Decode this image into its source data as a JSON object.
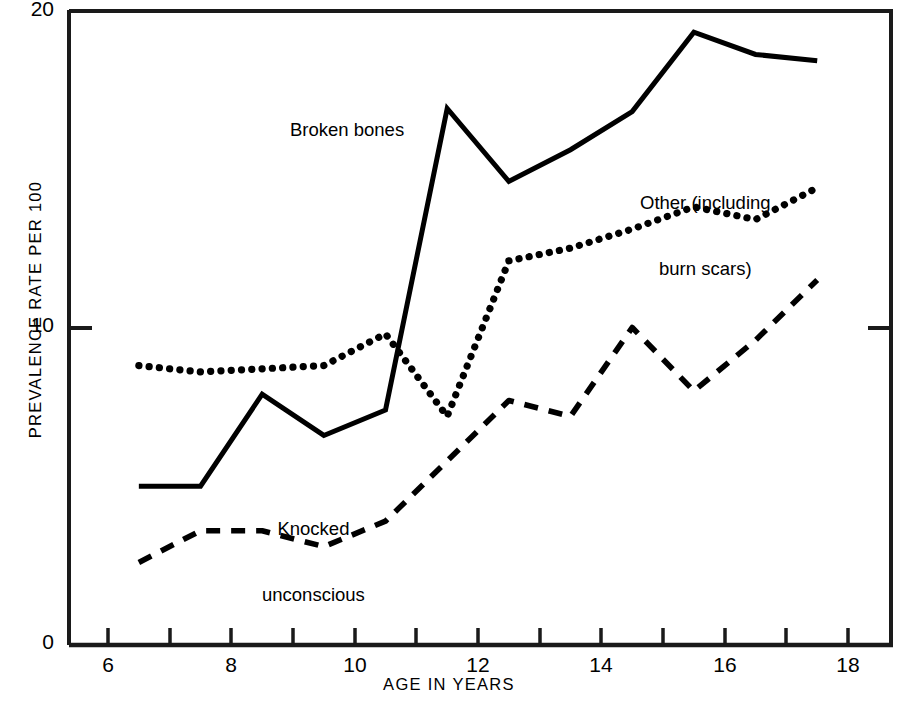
{
  "chart_data": {
    "type": "line",
    "title": "",
    "xlabel": "AGE IN YEARS",
    "ylabel": "PREVALENCE RATE PER 100",
    "xlim": [
      5.3,
      18.7
    ],
    "ylim": [
      0,
      20
    ],
    "x_ticks": [
      6,
      7,
      8,
      9,
      10,
      11,
      12,
      13,
      14,
      15,
      16,
      17,
      18
    ],
    "x_tick_labels": [
      "6",
      "",
      "8",
      "",
      "10",
      "",
      "12",
      "",
      "14",
      "",
      "16",
      "",
      "18"
    ],
    "y_ticks": [
      0,
      10,
      20
    ],
    "y_tick_labels": [
      "0",
      "10",
      "20"
    ],
    "grid": false,
    "legend_position": "inline-annotations",
    "x": [
      6.5,
      7.5,
      8.5,
      9.5,
      10.5,
      11.5,
      12.5,
      13.5,
      14.5,
      15.5,
      16.5,
      17.5
    ],
    "series": [
      {
        "name": "Broken bones",
        "style": "solid",
        "color": "#000000",
        "values": [
          5.0,
          5.0,
          7.9,
          6.6,
          7.4,
          16.9,
          14.6,
          15.6,
          16.8,
          19.3,
          18.6,
          18.4
        ]
      },
      {
        "name": "Other (including burn scars)",
        "style": "dotted",
        "color": "#000000",
        "values": [
          8.8,
          8.6,
          8.7,
          8.8,
          9.8,
          7.2,
          12.1,
          12.5,
          13.1,
          13.8,
          13.4,
          14.4
        ]
      },
      {
        "name": "Knocked unconscious",
        "style": "dashed",
        "color": "#000000",
        "values": [
          2.6,
          3.6,
          3.6,
          3.1,
          3.9,
          5.8,
          7.7,
          7.2,
          10.0,
          8.0,
          9.6,
          11.5
        ]
      }
    ],
    "annotations": [
      {
        "text": "Broken bones",
        "x": 9.2,
        "y": 17.3
      },
      {
        "text": "Other (including\nburn scars)",
        "x": 16.3,
        "y": 16.4
      },
      {
        "text": "Knocked\nunconscious",
        "x": 9.6,
        "y": 5.6
      }
    ]
  },
  "annotations": {
    "broken_bones": "Broken bones",
    "other_line1": "Other (including",
    "other_line2": "burn scars)",
    "knocked_line1": "Knocked",
    "knocked_line2": "unconscious"
  },
  "axes": {
    "y_title": "PREVALENCE RATE PER 100",
    "x_title": "AGE IN YEARS",
    "y_labels": {
      "top": "20",
      "mid": "10",
      "bottom": "0"
    },
    "x_labels": {
      "t6": "6",
      "t8": "8",
      "t10": "10",
      "t12": "12",
      "t14": "14",
      "t16": "16",
      "t18": "18"
    }
  },
  "colors": {
    "ink": "#1a1a1a",
    "background": "#ffffff"
  }
}
